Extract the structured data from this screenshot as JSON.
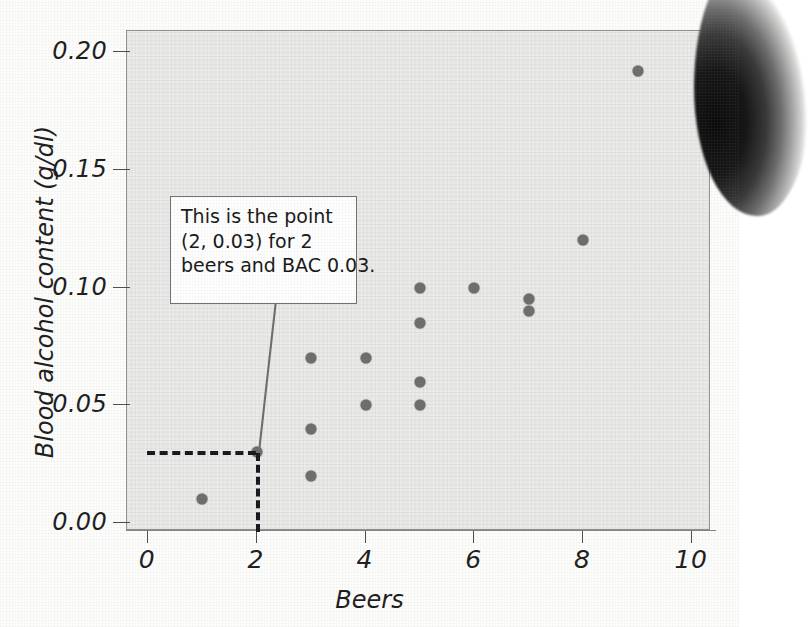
{
  "chart_data": {
    "type": "scatter",
    "title": "",
    "xlabel": "Beers",
    "ylabel": "Blood alcohol content (g/dl)",
    "xlim": [
      0,
      10
    ],
    "ylim": [
      0.0,
      0.2
    ],
    "xticks": [
      "0",
      "2",
      "4",
      "6",
      "8",
      "10"
    ],
    "xtick_values": [
      0,
      2,
      4,
      6,
      8,
      10
    ],
    "yticks": [
      "0.00",
      "0.05",
      "0.10",
      "0.15",
      "0.20"
    ],
    "ytick_values": [
      0.0,
      0.05,
      0.1,
      0.15,
      0.2
    ],
    "grid": false,
    "legend": null,
    "marker_color": "#6b6d6c",
    "panel_color": "#ececeb",
    "points": [
      {
        "x": 1,
        "y": 0.01
      },
      {
        "x": 2,
        "y": 0.03
      },
      {
        "x": 3,
        "y": 0.07
      },
      {
        "x": 3,
        "y": 0.04
      },
      {
        "x": 3,
        "y": 0.02
      },
      {
        "x": 4,
        "y": 0.07
      },
      {
        "x": 4,
        "y": 0.05
      },
      {
        "x": 5,
        "y": 0.1
      },
      {
        "x": 5,
        "y": 0.085
      },
      {
        "x": 5,
        "y": 0.06
      },
      {
        "x": 5,
        "y": 0.05
      },
      {
        "x": 6,
        "y": 0.1
      },
      {
        "x": 7,
        "y": 0.095
      },
      {
        "x": 7,
        "y": 0.09
      },
      {
        "x": 8,
        "y": 0.12
      },
      {
        "x": 9,
        "y": 0.192
      }
    ],
    "annotations": [
      {
        "lines": [
          "This is the point",
          "(2, 0.03) for 2",
          "beers and BAC 0.03."
        ],
        "target": {
          "x": 2,
          "y": 0.03
        }
      }
    ],
    "guide_lines": [
      {
        "orientation": "horizontal",
        "value": 0.03,
        "style": "dashed",
        "from_x": 0,
        "to_x": 2
      },
      {
        "orientation": "vertical",
        "value": 2,
        "style": "dashed",
        "from_y": 0.0,
        "to_y": 0.03
      }
    ]
  }
}
